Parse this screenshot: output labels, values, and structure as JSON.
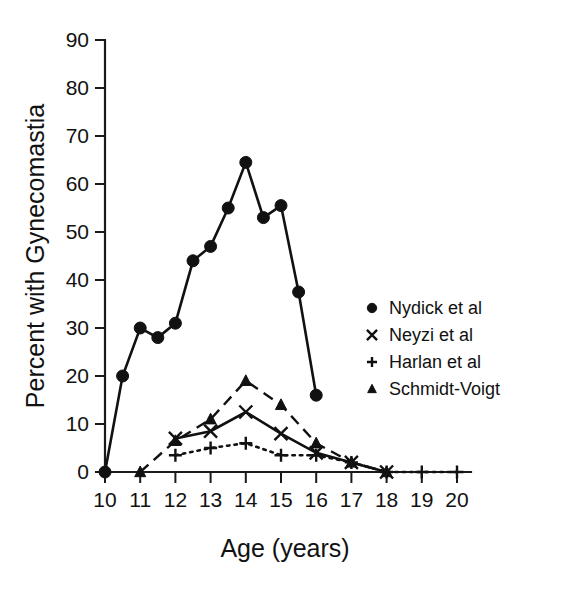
{
  "chart_data": {
    "type": "line",
    "title": "",
    "xlabel": "Age (years)",
    "ylabel": "Percent with Gynecomastia",
    "xlim": [
      10,
      20
    ],
    "ylim": [
      0,
      90
    ],
    "xticks": [
      10,
      11,
      12,
      13,
      14,
      15,
      16,
      17,
      18,
      19,
      20
    ],
    "yticks": [
      0,
      10,
      20,
      30,
      40,
      50,
      60,
      70,
      80,
      90
    ],
    "grid": false,
    "legend_position": "right-middle",
    "series": [
      {
        "name": "Nydick et al",
        "marker": "circle",
        "linestyle": "solid",
        "x": [
          10,
          10.5,
          11,
          11.5,
          12,
          12.5,
          13,
          13.5,
          14,
          14.5,
          15,
          15.5,
          16
        ],
        "values": [
          0,
          20,
          30,
          28,
          31,
          44,
          47,
          55,
          64.5,
          53,
          55.5,
          37.5,
          16
        ]
      },
      {
        "name": "Neyzi et al",
        "marker": "x",
        "linestyle": "solid",
        "x": [
          12,
          13,
          14,
          15,
          16,
          17,
          18
        ],
        "values": [
          7,
          8.5,
          12.5,
          8,
          4,
          2,
          0
        ]
      },
      {
        "name": "Harlan et al",
        "marker": "plus",
        "linestyle": "dotted",
        "x": [
          12,
          13,
          14,
          15,
          16,
          17,
          18,
          19,
          20
        ],
        "values": [
          3.5,
          5,
          6,
          3.5,
          3.5,
          2,
          0,
          0,
          0
        ]
      },
      {
        "name": "Schmidt-Voigt",
        "marker": "triangle",
        "linestyle": "dashed",
        "x": [
          11,
          12,
          13,
          14,
          15,
          16,
          17,
          18
        ],
        "values": [
          0,
          6.5,
          11,
          19,
          14,
          6,
          2,
          0
        ]
      }
    ],
    "legend": [
      {
        "label": "Nydick et al",
        "marker": "circle"
      },
      {
        "label": "Neyzi et al",
        "marker": "x"
      },
      {
        "label": "Harlan et al",
        "marker": "plus"
      },
      {
        "label": "Schmidt-Voigt",
        "marker": "triangle"
      }
    ]
  }
}
